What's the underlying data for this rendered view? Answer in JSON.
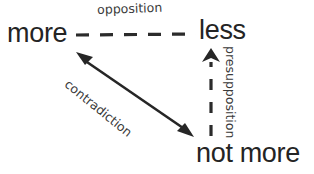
{
  "diagram": {
    "background_color": "#ffffff",
    "text_color": "#242424",
    "label_color": "#3a3a3a",
    "line_color": "#262626",
    "terms": [
      {
        "id": "more",
        "text": "more",
        "x": 7,
        "y": 20
      },
      {
        "id": "less",
        "text": "less",
        "x": 199,
        "y": 17
      },
      {
        "id": "not-more",
        "text_part_1": "not",
        "text_part_2": "more",
        "x": 196,
        "y": 140
      }
    ],
    "relations": [
      {
        "id": "opposition",
        "label": "opposition",
        "from": "more",
        "to": "less",
        "style": "dashed",
        "arrowheads": "none",
        "orientation": "horizontal"
      },
      {
        "id": "contradiction",
        "label": "contradiction",
        "from": "more",
        "to": "not more",
        "style": "solid",
        "arrowheads": "both",
        "orientation": "diagonal"
      },
      {
        "id": "presupposition",
        "label": "presupposition",
        "from": "not more",
        "to": "less",
        "style": "dashed",
        "arrowheads": "up",
        "orientation": "vertical"
      }
    ]
  }
}
